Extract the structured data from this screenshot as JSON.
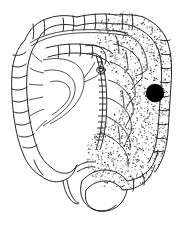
{
  "figure": {
    "background_color": "#ffffff",
    "ink_color": "#1a1a1a",
    "stipple_color": "#3a3a3a",
    "marker_color": "#000000",
    "caption": "",
    "width": 182,
    "height": 227
  },
  "regions": {
    "ascending_colon": "Ascending colon",
    "transverse_colon": "Transverse colon",
    "hepatic_flexure": "Hepatic flexure",
    "splenic_flexure": "Splenic flexure",
    "descending_colon": "Descending colon",
    "sigmoid_colon": "Sigmoid colon",
    "rectum": "Rectum",
    "cecum": "Cecum",
    "appendix": "Appendix",
    "mesentery": "Mesentery with vascular arcades",
    "marginal_artery": "Marginal artery",
    "ileum": "Terminal ileum"
  },
  "shading": {
    "label": "Stippled shading — distal transverse, descending and sigmoid colon",
    "dot_color": "#333333",
    "dot_count": 2600,
    "seed": 20240517
  },
  "marker": {
    "label": "Lesion marker",
    "shape": "filled-circle",
    "color": "#000000",
    "cx": 155,
    "cy": 93,
    "r": 9.2
  },
  "chart_data": {
    "type": "diagram",
    "annotations": [
      {
        "name": "lesion-marker",
        "x": 155,
        "y": 93,
        "value": "filled black dot"
      },
      {
        "name": "shaded-segment",
        "value": "stippled region from splenic flexure through sigmoid"
      }
    ]
  }
}
